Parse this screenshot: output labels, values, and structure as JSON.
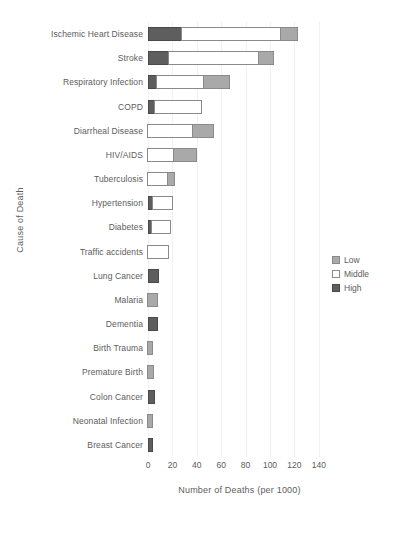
{
  "chart_data": {
    "type": "bar",
    "orientation": "horizontal",
    "stacked": true,
    "title": "",
    "xlabel": "Number of Deaths (per 1000)",
    "ylabel": "Cause of Death",
    "xlim": [
      0,
      150
    ],
    "xticks": [
      0,
      20,
      40,
      60,
      80,
      100,
      120,
      140
    ],
    "xtick_labels": [
      "0",
      "20",
      "40",
      "60",
      "80",
      "100",
      "120",
      "140"
    ],
    "grid": true,
    "legend_position": "center right",
    "legend_entries": [
      "Low",
      "Middle",
      "High"
    ],
    "segment_order_left_to_right": [
      "High",
      "Middle",
      "Low"
    ],
    "categories": [
      "Ischemic Heart Disease",
      "Stroke",
      "Respiratory Infection",
      "COPD",
      "Diarrheal Disease",
      "HIV/AIDS",
      "Tuberculosis",
      "Hypertension",
      "Diabetes",
      "Traffic accidents",
      "Lung Cancer",
      "Malaria",
      "Dementia",
      "Birth Trauma",
      "Premature Birth",
      "Colon Cancer",
      "Neonatal Infection",
      "Breast Cancer"
    ],
    "series": [
      {
        "name": "High",
        "color": "#5e5e5e",
        "values": [
          28,
          17,
          7,
          6,
          0,
          0,
          0,
          4,
          3,
          0,
          9,
          0,
          8,
          0,
          0,
          6,
          0,
          4
        ]
      },
      {
        "name": "Middle",
        "color": "#ffffff",
        "values": [
          82,
          75,
          40,
          39,
          38,
          22,
          17,
          17,
          17,
          18,
          0,
          0,
          0,
          0,
          0,
          0,
          0,
          0
        ]
      },
      {
        "name": "Low",
        "color": "#a9a9a9",
        "values": [
          15,
          13,
          22,
          0,
          18,
          20,
          7,
          0,
          0,
          0,
          0,
          9,
          0,
          5,
          6,
          0,
          5,
          0
        ]
      }
    ],
    "totals": [
      125,
      105,
      69,
      45,
      56,
      42,
      24,
      21,
      20,
      18,
      9,
      9,
      8,
      5,
      6,
      6,
      5,
      4
    ]
  },
  "legend": {
    "items": [
      {
        "label": "Low",
        "swatch": "low"
      },
      {
        "label": "Middle",
        "swatch": "middle"
      },
      {
        "label": "High",
        "swatch": "high"
      }
    ]
  },
  "colors": {
    "high": "#5e5e5e",
    "middle": "#ffffff",
    "low": "#a9a9a9",
    "outline": "#8a8a8a",
    "grid": "#f1f1f1",
    "text": "#5c5c5c",
    "background": "#ffffff"
  }
}
